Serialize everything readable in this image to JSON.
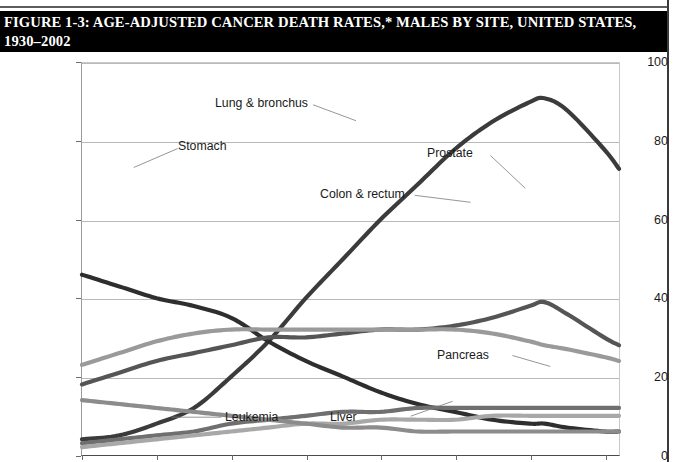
{
  "figure": {
    "title": "FIGURE 1-3: AGE-ADJUSTED CANCER DEATH RATES,* MALES BY SITE, UNITED STATES, 1930–2002"
  },
  "chart_data": {
    "type": "line",
    "title": "FIGURE 1-3: AGE-ADJUSTED CANCER DEATH RATES,* MALES BY SITE, UNITED STATES, 1930–2002",
    "xlabel": "",
    "ylabel": "Rate per 100,000 male population",
    "xlim": [
      1930,
      2002
    ],
    "ylim": [
      0,
      100
    ],
    "yticks": [
      0,
      20,
      40,
      60,
      80,
      100
    ],
    "ytick_labels": [
      "0",
      "20",
      "40",
      "60",
      "80",
      "100"
    ],
    "xticks": [
      1930,
      1940,
      1950,
      1960,
      1970,
      1980,
      1990,
      2000
    ],
    "grid": true,
    "legend": "inline-annotations",
    "x": [
      1930,
      1935,
      1940,
      1945,
      1950,
      1955,
      1960,
      1965,
      1970,
      1975,
      1980,
      1985,
      1990,
      1992,
      1995,
      2000,
      2002
    ],
    "series": [
      {
        "name": "Lung & bronchus",
        "color": "#3b3b3b",
        "values": [
          4,
          5,
          8,
          12,
          20,
          29,
          40,
          50,
          60,
          69,
          78,
          85,
          90,
          91,
          88,
          78,
          73
        ]
      },
      {
        "name": "Stomach",
        "color": "#2e2e2e",
        "values": [
          46,
          43,
          40,
          38,
          35,
          29,
          24,
          20,
          16,
          13,
          11,
          9,
          8,
          8,
          7,
          6,
          6
        ]
      },
      {
        "name": "Prostate",
        "color": "#555555",
        "values": [
          18,
          21,
          24,
          26,
          28,
          30,
          30,
          31,
          32,
          32,
          33,
          35,
          38,
          39,
          36,
          30,
          28
        ]
      },
      {
        "name": "Colon & rectum",
        "color": "#9a9a9a",
        "values": [
          23,
          26,
          29,
          31,
          32,
          32,
          32,
          32,
          32,
          32,
          32,
          31,
          29,
          28,
          27,
          25,
          24
        ]
      },
      {
        "name": "Pancreas",
        "color": "#6f6f6f",
        "values": [
          3,
          4,
          5,
          6,
          8,
          9,
          10,
          11,
          11,
          12,
          12,
          12,
          12,
          12,
          12,
          12,
          12
        ]
      },
      {
        "name": "Leukemia",
        "color": "#a8a8a8",
        "values": [
          2,
          3,
          4,
          5,
          6,
          7,
          8,
          8,
          9,
          9,
          9,
          10,
          10,
          10,
          10,
          10,
          10
        ]
      },
      {
        "name": "Liver",
        "color": "#8c8c8c",
        "values": [
          14,
          13,
          12,
          11,
          10,
          9,
          8,
          7,
          7,
          6,
          6,
          6,
          6,
          6,
          6,
          6,
          6
        ]
      }
    ],
    "annotations": [
      {
        "text": "Lung & bronchus",
        "key": "lung"
      },
      {
        "text": "Stomach",
        "key": "stomach"
      },
      {
        "text": "Prostate",
        "key": "prostate"
      },
      {
        "text": "Colon & rectum",
        "key": "colon"
      },
      {
        "text": "Pancreas",
        "key": "pancreas"
      },
      {
        "text": "Leukemia",
        "key": "leukemia"
      },
      {
        "text": "Liver",
        "key": "liver"
      }
    ]
  }
}
